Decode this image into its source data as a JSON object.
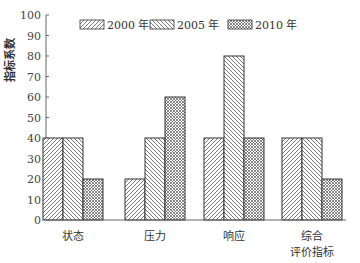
{
  "chart_data": {
    "type": "bar",
    "title": "",
    "xlabel": "",
    "ylabel": "指标系数",
    "ylim": [
      0,
      100
    ],
    "yticks": [
      0,
      10,
      20,
      30,
      40,
      50,
      60,
      70,
      80,
      90,
      100
    ],
    "grid": false,
    "legend_position": "top",
    "categories": [
      "状态",
      "压力",
      "响应",
      "综合\n评价指标"
    ],
    "category_lines": [
      [
        "状态"
      ],
      [
        "压力"
      ],
      [
        "响应"
      ],
      [
        "综合",
        "评价指标"
      ]
    ],
    "series": [
      {
        "name": "2000 年",
        "pattern": "diagonal-up",
        "values": [
          40,
          20,
          40,
          40
        ]
      },
      {
        "name": "2005 年",
        "pattern": "diagonal-down",
        "values": [
          40,
          40,
          80,
          40
        ]
      },
      {
        "name": "2010 年",
        "pattern": "crosshatch",
        "values": [
          20,
          60,
          40,
          20
        ]
      }
    ]
  },
  "colors": {
    "stroke": "#333333",
    "hatch": "#555555",
    "axis": "#666666"
  }
}
